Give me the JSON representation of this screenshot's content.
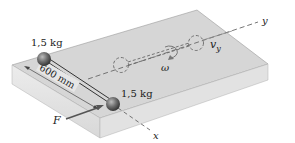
{
  "diagram": {
    "masses": [
      {
        "label": "1,5 kg",
        "role": "upper mass"
      },
      {
        "label": "1,5 kg",
        "role": "lower mass"
      }
    ],
    "rod_length_label": "600 mm",
    "force_label": "F",
    "axes": {
      "x": "x",
      "y": "y"
    },
    "angular_velocity_label": "ω",
    "velocity_label": "v",
    "velocity_subscript": "y",
    "colors": {
      "surface_top": "#d9d9d9",
      "surface_front": "#e6e6e6",
      "surface_side": "#c8c8c8",
      "edge": "#8a8a8a",
      "sphere": "#6b6b6b",
      "dashed": "#666666",
      "text": "#1a1a1a"
    }
  }
}
